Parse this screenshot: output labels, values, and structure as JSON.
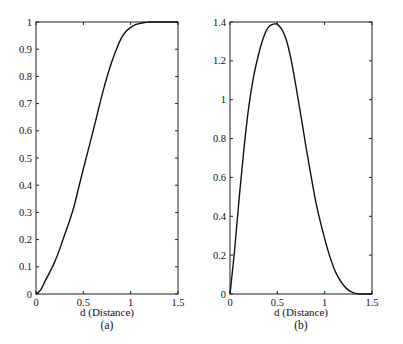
{
  "chart_data": [
    {
      "id": "a",
      "type": "line",
      "caption": "(a)",
      "title": "",
      "xlabel": "d (Distance)",
      "ylabel": "",
      "xlim": [
        0,
        1.5
      ],
      "ylim": [
        0,
        1
      ],
      "grid": false,
      "xticks": [
        0,
        0.5,
        1,
        1.5
      ],
      "xtick_labels": [
        "0",
        "0.5",
        "1",
        "1.5"
      ],
      "yticks": [
        0,
        0.1,
        0.2,
        0.3,
        0.4,
        0.5,
        0.6,
        0.7,
        0.8,
        0.9,
        1
      ],
      "ytick_labels": [
        "0",
        "0.1",
        "0.2",
        "0.3",
        "0.4",
        "0.5",
        "0.6",
        "0.7",
        "0.8",
        "0.9",
        "1"
      ],
      "series": [
        {
          "name": "curve",
          "color": "#111111",
          "x": [
            0,
            0.05,
            0.1,
            0.15,
            0.2,
            0.25,
            0.3,
            0.35,
            0.4,
            0.45,
            0.5,
            0.55,
            0.6,
            0.65,
            0.7,
            0.75,
            0.8,
            0.85,
            0.9,
            0.95,
            1.0,
            1.05,
            1.1,
            1.15,
            1.2,
            1.3,
            1.4,
            1.5
          ],
          "values": [
            0,
            0.015,
            0.05,
            0.083,
            0.12,
            0.165,
            0.215,
            0.265,
            0.32,
            0.39,
            0.46,
            0.527,
            0.595,
            0.665,
            0.735,
            0.798,
            0.853,
            0.9,
            0.94,
            0.965,
            0.98,
            0.99,
            0.995,
            0.998,
            1.0,
            1.0,
            1.0,
            1.0
          ]
        }
      ]
    },
    {
      "id": "b",
      "type": "line",
      "caption": "(b)",
      "title": "",
      "xlabel": "d (Distance)",
      "ylabel": "",
      "xlim": [
        0,
        1.5
      ],
      "ylim": [
        0,
        1.4
      ],
      "grid": false,
      "xticks": [
        0,
        0.5,
        1,
        1.5
      ],
      "xtick_labels": [
        "0",
        "0.5",
        "1",
        "1.5"
      ],
      "yticks": [
        0,
        0.2,
        0.4,
        0.6,
        0.8,
        1,
        1.2,
        1.4
      ],
      "ytick_labels": [
        "0",
        "0.2",
        "0.4",
        "0.6",
        "0.8",
        "1",
        "1.2",
        "1.4"
      ],
      "series": [
        {
          "name": "curve",
          "color": "#111111",
          "x": [
            0,
            0.05,
            0.1,
            0.15,
            0.2,
            0.25,
            0.3,
            0.35,
            0.4,
            0.45,
            0.48,
            0.5,
            0.55,
            0.6,
            0.65,
            0.7,
            0.75,
            0.8,
            0.85,
            0.9,
            0.95,
            1.0,
            1.05,
            1.1,
            1.15,
            1.2,
            1.25,
            1.3,
            1.35,
            1.4,
            1.5
          ],
          "values": [
            0,
            0.233,
            0.51,
            0.76,
            0.97,
            1.12,
            1.23,
            1.315,
            1.37,
            1.388,
            1.39,
            1.388,
            1.36,
            1.3,
            1.195,
            1.06,
            0.915,
            0.765,
            0.625,
            0.49,
            0.38,
            0.285,
            0.2,
            0.13,
            0.08,
            0.045,
            0.02,
            0.007,
            0.001,
            0,
            0
          ]
        }
      ]
    }
  ],
  "layout": {
    "panels": [
      {
        "left": 36,
        "top": 22,
        "width": 142,
        "height": 272
      },
      {
        "left": 230,
        "top": 22,
        "width": 142,
        "height": 272
      }
    ]
  }
}
